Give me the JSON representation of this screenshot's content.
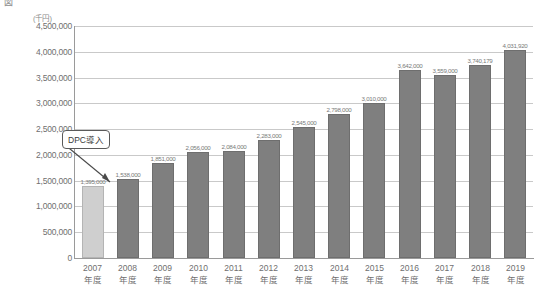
{
  "chart_title": "図　　　　　　　　　　　　　　　　　　　　　　",
  "y_unit_label": "(千円)",
  "annotation": {
    "label": "DPC導入",
    "points_to_category": "2008年度"
  },
  "y_ticks": [
    "4,500,000",
    "4,000,000",
    "3,500,000",
    "3,000,000",
    "2,500,000",
    "2,000,000",
    "1,500,000",
    "1,000,000",
    "500,000",
    "0"
  ],
  "chart_data": {
    "type": "bar",
    "title": "",
    "xlabel": "",
    "ylabel": "(千円)",
    "ylim": [
      0,
      4500000
    ],
    "ytick_interval": 500000,
    "grid": true,
    "legend": false,
    "categories": [
      "2007年度",
      "2008年度",
      "2009年度",
      "2010年度",
      "2011年度",
      "2012年度",
      "2013年度",
      "2014年度",
      "2015年度",
      "2016年度",
      "2017年度",
      "2018年度",
      "2019年度"
    ],
    "category_years": [
      "2007",
      "2008",
      "2009",
      "2010",
      "2011",
      "2012",
      "2013",
      "2014",
      "2015",
      "2016",
      "2017",
      "2018",
      "2019"
    ],
    "category_suffix": "年度",
    "values": [
      1395000,
      1538000,
      1851000,
      2056000,
      2084000,
      2283000,
      2545000,
      2798000,
      3010000,
      3642000,
      3559000,
      3740000,
      4031000
    ],
    "value_labels": [
      "1,395,000",
      "1,538,000",
      "1,851,000",
      "2,056,000",
      "2,084,000",
      "2,283,000",
      "2,545,000",
      "2,798,000",
      "3,010,000",
      "3,642,000",
      "3,559,000",
      "3,740,179",
      "4,031,920"
    ],
    "bar_colors": [
      "#cfcfcf",
      "#7f7f7f",
      "#7f7f7f",
      "#7f7f7f",
      "#7f7f7f",
      "#7f7f7f",
      "#7f7f7f",
      "#7f7f7f",
      "#7f7f7f",
      "#7f7f7f",
      "#7f7f7f",
      "#7f7f7f",
      "#7f7f7f"
    ],
    "highlight_color": "#cfcfcf",
    "series_color": "#7f7f7f"
  }
}
